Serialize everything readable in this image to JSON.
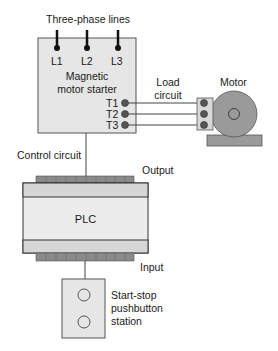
{
  "diagram": {
    "labels": {
      "three_phase": "Three-phase lines",
      "l1": "L1",
      "l2": "L2",
      "l3": "L3",
      "starter_line1": "Magnetic",
      "starter_line2": "motor starter",
      "t1": "T1",
      "t2": "T2",
      "t3": "T3",
      "load_line1": "Load",
      "load_line2": "circuit",
      "motor": "Motor",
      "control_circuit": "Control circuit",
      "output": "Output",
      "plc": "PLC",
      "input": "Input",
      "station_line1": "Start-stop",
      "station_line2": "pushbutton",
      "station_line3": "station"
    },
    "colors": {
      "box_fill": "#e6e6e6",
      "plc_body": "#ececec",
      "plc_strip": "#d6d6d6",
      "connector": "#8a8a8a",
      "motor_fill": "#9a9a9a",
      "terminal_dot": "#555555",
      "line": "#333333"
    }
  }
}
